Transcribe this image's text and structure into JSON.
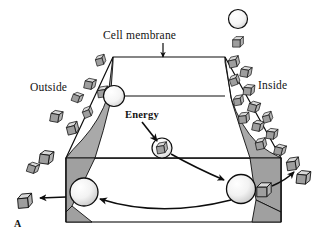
{
  "figure": {
    "panel_label": "A",
    "title_label": "Cell membrane",
    "labels": {
      "cell_membrane": "Cell membrane",
      "outside": "Outside",
      "inside": "Inside",
      "energy": "Energy"
    },
    "colors": {
      "ink": "#0d0d0d",
      "membrane_fill": "#ffffff",
      "channel_shading": "#a9a9a9",
      "wedge_shading": "#a0a0a0",
      "cube_top": "#d9d9d9",
      "cube_front": "#9a9a9a",
      "cube_side": "#bdbdbd",
      "sphere_fill": "#efefef",
      "sphere_shadow": "#c9c9c9",
      "background": "#ffffff"
    },
    "structures": {
      "membrane_top_face": "trapezoid",
      "membrane_body": "rectangle",
      "channel": "hourglass-shaped pore narrowing at the top",
      "carrier_protein_shape": "sphere",
      "molecule_shape": "cube"
    },
    "carriers": [
      {
        "name": "carrier-top-left",
        "cx": 114,
        "cy": 96,
        "r": 11,
        "cargo": "loaded",
        "cargo_side": "left"
      },
      {
        "name": "carrier-center",
        "cx": 162,
        "cy": 148,
        "r": 10,
        "cargo": "loaded",
        "cargo_side": "inside"
      },
      {
        "name": "carrier-bottom-right",
        "cx": 241,
        "cy": 189,
        "r": 14,
        "cargo": "loaded",
        "cargo_side": "right"
      },
      {
        "name": "carrier-bottom-left",
        "cx": 84,
        "cy": 192,
        "r": 14,
        "cargo": "empty",
        "cargo_side": "none"
      }
    ],
    "legend": {
      "carrier_symbol": "circle",
      "molecule_symbol": "cube",
      "cx": 238,
      "cy": 22
    },
    "arrows": [
      {
        "name": "arrow-energy",
        "from": "Energy label",
        "to": "carrier-center",
        "style": "straight"
      },
      {
        "name": "arrow-center-to-right",
        "from": "carrier-center",
        "to": "carrier-bottom-right",
        "style": "curved"
      },
      {
        "name": "arrow-right-release",
        "from": "carrier-bottom-right",
        "to": "molecule inside",
        "style": "curved"
      },
      {
        "name": "arrow-return",
        "from": "carrier-bottom-right",
        "to": "carrier-bottom-left",
        "style": "curved"
      },
      {
        "name": "arrow-left-release",
        "from": "carrier-bottom-left",
        "to": "molecule outside",
        "style": "straight"
      },
      {
        "name": "leader-cell-membrane",
        "from": "Cell membrane label",
        "to": "membrane top edge",
        "style": "straight"
      }
    ],
    "molecules_outside_count": 11,
    "molecules_inside_count": 15
  }
}
